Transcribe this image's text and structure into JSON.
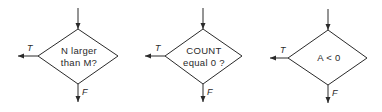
{
  "diagram": {
    "type": "flowchart-decision-symbols",
    "decisions": [
      {
        "id": "d1",
        "lines": [
          "N larger",
          "than M?"
        ],
        "true_label": "T",
        "false_label": "F",
        "geometry": {
          "cx": 78,
          "top": 29,
          "bottom": 84,
          "left": 38,
          "right": 118,
          "cy": 56,
          "in_start": 8,
          "t_tip": 18,
          "f_tip": 102
        }
      },
      {
        "id": "d2",
        "lines": [
          "COUNT",
          "equal 0 ?"
        ],
        "true_label": "T",
        "false_label": "F",
        "geometry": {
          "cx": 203,
          "top": 29,
          "bottom": 84,
          "left": 165,
          "right": 242,
          "cy": 56,
          "in_start": 8,
          "t_tip": 145,
          "f_tip": 102
        }
      },
      {
        "id": "d3",
        "lines": [
          "A < 0"
        ],
        "true_label": "T",
        "false_label": "F",
        "geometry": {
          "cx": 328,
          "top": 30,
          "bottom": 85,
          "left": 288,
          "right": 367,
          "cy": 58,
          "in_start": 9,
          "t_tip": 270,
          "f_tip": 103
        }
      }
    ]
  }
}
